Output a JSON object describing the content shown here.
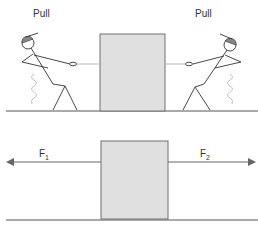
{
  "top_scene": {
    "left_label": "Pull",
    "right_label": "Pull"
  },
  "bottom_scene": {
    "force_left_label": "F",
    "force_left_sub": "1",
    "force_right_label": "F",
    "force_right_sub": "2"
  },
  "colors": {
    "box_fill": "#e0e0e0",
    "box_stroke": "#707070",
    "ground": "#555555",
    "figure": "#333333",
    "rope": "#bbbbbb",
    "cap": "#888888",
    "arrow": "#666666"
  }
}
